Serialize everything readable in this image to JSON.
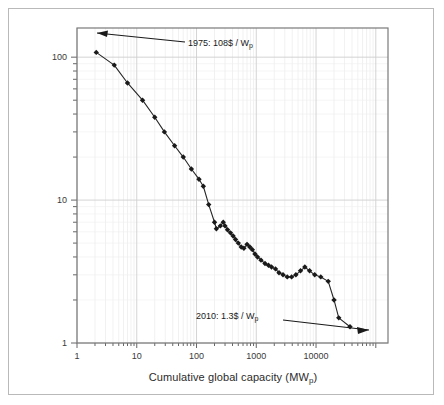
{
  "figure": {
    "background_color": "#ffffff",
    "frame_color": "#b9b9b9",
    "plot_border_color": "#7a7a7a",
    "grid_color": "#dcdcdc",
    "series_color": "#262626",
    "marker_color": "#1a1a1a"
  },
  "axes": {
    "x_title_main": "Cumulative global capacity (MW",
    "x_title_sub": "p",
    "x_title_tail": ")",
    "x_ticks": [
      {
        "label": "1",
        "value": 1
      },
      {
        "label": "10",
        "value": 10
      },
      {
        "label": "100",
        "value": 100
      },
      {
        "label": "1000",
        "value": 1000
      },
      {
        "label": "10000",
        "value": 10000
      }
    ],
    "y_ticks": [
      {
        "label": "1",
        "value": 1
      },
      {
        "label": "10",
        "value": 10
      },
      {
        "label": "100",
        "value": 100
      }
    ]
  },
  "annotations": [
    {
      "id": "annotation-1975",
      "text_main": "1975: 108$ / W",
      "text_sub": "p",
      "year": 1975,
      "price": 108,
      "capacity": 2.1,
      "unit": "$ / Wp"
    },
    {
      "id": "annotation-2010",
      "text_main": "2010: 1.3$ / W",
      "text_sub": "p",
      "year": 2010,
      "price": 1.3,
      "capacity": 37000,
      "unit": "$ / Wp"
    }
  ],
  "chart_data": {
    "type": "line",
    "title": "",
    "subtitle": "",
    "xlabel": "Cumulative global capacity (MWp)",
    "ylabel": "",
    "xscale": "log",
    "yscale": "log",
    "xlim": [
      1,
      160000
    ],
    "ylim": [
      1,
      160
    ],
    "grid": true,
    "legend": null,
    "series": [
      {
        "name": "PV module price experience curve",
        "x": [
          2.1,
          4.2,
          7.0,
          12.5,
          20.0,
          29.0,
          43.0,
          60.0,
          82.0,
          110.0,
          130.0,
          160.0,
          200.0,
          215.0,
          250.0,
          280.0,
          300.0,
          330.0,
          370.0,
          410.0,
          450.0,
          500.0,
          560.0,
          620.0,
          700.0,
          780.0,
          860.0,
          950.0,
          1050.0,
          1200.0,
          1400.0,
          1600.0,
          1800.0,
          2100.0,
          2400.0,
          2800.0,
          3300.0,
          3900.0,
          4600.0,
          5500.0,
          6500.0,
          7800.0,
          9500.0,
          12000.0,
          16000.0,
          20000.0,
          24000.0,
          37000.0
        ],
        "y": [
          108.0,
          88.0,
          66.0,
          50.0,
          38.0,
          30.0,
          24.0,
          20.0,
          16.5,
          14.0,
          12.5,
          9.3,
          7.0,
          6.3,
          6.6,
          7.0,
          6.6,
          6.2,
          5.9,
          5.6,
          5.3,
          5.0,
          4.7,
          4.6,
          4.9,
          4.7,
          4.5,
          4.2,
          4.0,
          3.8,
          3.6,
          3.5,
          3.4,
          3.3,
          3.1,
          3.0,
          2.9,
          2.9,
          3.0,
          3.2,
          3.4,
          3.2,
          3.0,
          2.9,
          2.7,
          2.0,
          1.5,
          1.3
        ]
      }
    ]
  }
}
